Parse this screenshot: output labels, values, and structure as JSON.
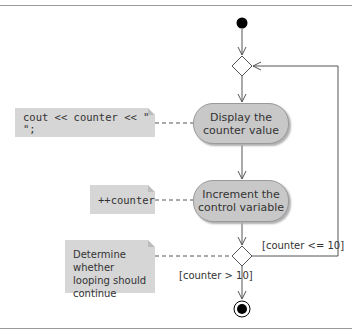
{
  "diagram": {
    "type": "UML activity diagram",
    "actions": [
      {
        "label_line1": "Display the",
        "label_line2": "counter value"
      },
      {
        "label_line1": "Increment the",
        "label_line2": "control variable"
      }
    ],
    "notes": [
      {
        "text": "cout << counter << \" \";"
      },
      {
        "text": "++counter"
      },
      {
        "line1": "Determine whether",
        "line2": "looping should",
        "line3": "continue"
      }
    ],
    "guards": {
      "loop": "[counter <= 10]",
      "exit": "[counter > 10]"
    },
    "colors": {
      "action_fill": "#c8c8c8",
      "note_fill": "#d6d6d6",
      "line": "#555555",
      "node": "#000000"
    }
  }
}
